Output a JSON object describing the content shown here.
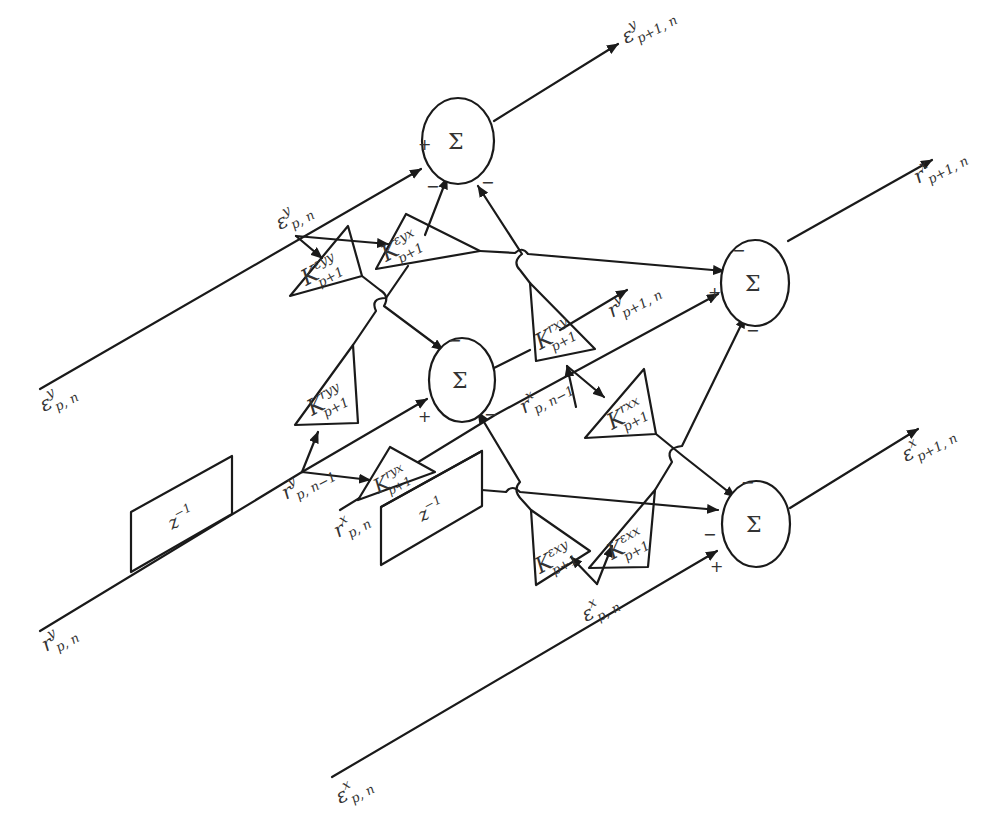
{
  "diagram": {
    "type": "two-channel lattice filter stage",
    "colors": {
      "stroke": "#1a1a1a",
      "text": "#333333",
      "background": "#ffffff"
    },
    "sum_symbol": "Σ",
    "inputs": {
      "eps_y_in": {
        "base": "ε",
        "sup": "y",
        "sub": "p, n"
      },
      "r_y_in": {
        "base": "r",
        "sup": "y",
        "sub": "p, n"
      },
      "r_x_in": {
        "base": "r",
        "sup": "x",
        "sub": "p, n"
      },
      "eps_x_in": {
        "base": "ε",
        "sup": "x",
        "sub": "p, n"
      },
      "eps_y_tap": {
        "base": "ε",
        "sup": "y",
        "sub": "p, n"
      },
      "eps_x_tap": {
        "base": "ε",
        "sup": "x",
        "sub": "p, n"
      }
    },
    "delayed": {
      "r_y_delayed": {
        "base": "r",
        "sup": "y",
        "sub": "p, n−1"
      },
      "r_x_delayed": {
        "base": "r",
        "sup": "x",
        "sub": "p, n−1"
      }
    },
    "outputs": {
      "eps_y_out": {
        "base": "ε",
        "sup": "y",
        "sub": "p+1, n"
      },
      "r_x_out": {
        "base": "r",
        "sup": "x",
        "sub": "p+1, n"
      },
      "r_y_out": {
        "base": "r",
        "sup": "y",
        "sub": "p+1, n"
      },
      "eps_x_out": {
        "base": "ε",
        "sup": "x",
        "sub": "p+1, n"
      }
    },
    "delays": [
      {
        "id": "delay-y",
        "label": "z",
        "exp": "−1"
      },
      {
        "id": "delay-x",
        "label": "z",
        "exp": "−1"
      }
    ],
    "gains": {
      "k_eyy": {
        "base": "K",
        "sup": "εyy",
        "sub": "p+1"
      },
      "k_eyx": {
        "base": "K",
        "sup": "εyx",
        "sub": "p+1"
      },
      "k_ryy": {
        "base": "K",
        "sup": "ryy",
        "sub": "p+1"
      },
      "k_rxy": {
        "base": "K",
        "sup": "rxy",
        "sub": "p+1"
      },
      "k_ryx": {
        "base": "K",
        "sup": "ryx",
        "sub": "p+1"
      },
      "k_rxx": {
        "base": "K",
        "sup": "rxx",
        "sub": "p+1"
      },
      "k_exy": {
        "base": "K",
        "sup": "εxy",
        "sub": "p+1"
      },
      "k_exx": {
        "base": "K",
        "sup": "εxx",
        "sub": "p+1"
      }
    },
    "signs": {
      "plus": "+",
      "minus": "−"
    },
    "summers": [
      {
        "id": "sum-eps-y",
        "signs": [
          "+",
          "−",
          "−"
        ]
      },
      {
        "id": "sum-r-y",
        "signs": [
          "+",
          "−",
          "−"
        ]
      },
      {
        "id": "sum-r-x",
        "signs": [
          "+",
          "−",
          "−"
        ]
      },
      {
        "id": "sum-eps-x",
        "signs": [
          "+",
          "−",
          "−"
        ]
      }
    ]
  }
}
